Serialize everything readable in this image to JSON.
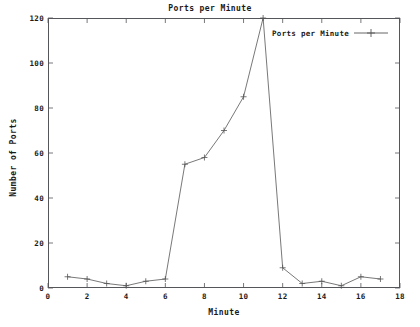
{
  "chart_data": {
    "type": "line",
    "title": "Ports per Minute",
    "xlabel": "Minute",
    "ylabel": "Number of Ports",
    "xlim": [
      0,
      18
    ],
    "ylim": [
      0,
      120
    ],
    "xticks": [
      0,
      2,
      4,
      6,
      8,
      10,
      12,
      14,
      16,
      18
    ],
    "yticks": [
      0,
      20,
      40,
      60,
      80,
      100,
      120
    ],
    "grid": false,
    "legend_position": "top-right",
    "marker": "plus",
    "line_color": "#555555",
    "series": [
      {
        "name": "Ports per Minute",
        "x": [
          1,
          2,
          3,
          4,
          5,
          6,
          7,
          8,
          9,
          10,
          11,
          12,
          13,
          14,
          15,
          16,
          17
        ],
        "values": [
          5,
          4,
          2,
          1,
          3,
          4,
          55,
          58,
          70,
          85,
          120,
          9,
          2,
          3,
          1,
          5,
          4
        ]
      }
    ]
  },
  "legend": {
    "entries": [
      {
        "label": "Ports per Minute"
      }
    ]
  },
  "axis": {
    "x_tick_labels": [
      "0",
      "2",
      "4",
      "6",
      "8",
      "10",
      "12",
      "14",
      "16",
      "18"
    ],
    "y_tick_labels": [
      "0",
      "20",
      "40",
      "60",
      "80",
      "100",
      "120"
    ]
  }
}
